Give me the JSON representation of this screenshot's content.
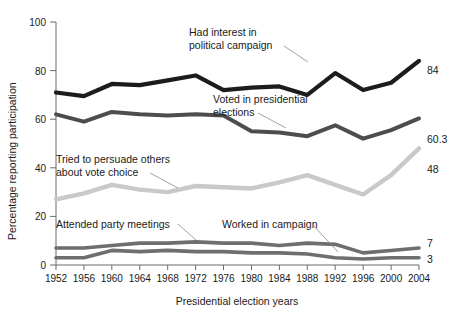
{
  "chart_data": {
    "type": "line",
    "title": "",
    "xlabel": "Presidential election years",
    "ylabel": "Percentage reporting participation",
    "categories": [
      1952,
      1956,
      1960,
      1964,
      1968,
      1972,
      1976,
      1980,
      1984,
      1988,
      1992,
      1996,
      2000,
      2004
    ],
    "xtick_labels": [
      "1952",
      "1956",
      "1960",
      "1964",
      "1968",
      "1972",
      "1976",
      "1980",
      "1984",
      "1988",
      "1992",
      "1996",
      "2000",
      "2004"
    ],
    "ytick_labels": [
      "0",
      "20",
      "40",
      "60",
      "80",
      "100"
    ],
    "yticks": [
      0,
      20,
      40,
      60,
      80,
      100
    ],
    "ylim": [
      0,
      100
    ],
    "xlim": [
      1952,
      2004
    ],
    "grid": false,
    "legend": "inline-annotations",
    "series": [
      {
        "name": "Had interest in political campaign",
        "color": "#1c1c1c",
        "end_value_label": "84",
        "values": [
          71,
          69.5,
          74.5,
          74,
          76,
          78,
          72,
          73,
          73.5,
          70,
          79,
          72,
          75,
          84
        ]
      },
      {
        "name": "Voted in presidential elections",
        "color": "#4d4d4d",
        "end_value_label": "60.3",
        "values": [
          62,
          59,
          63,
          62,
          61.5,
          62,
          61.5,
          55,
          54.5,
          53,
          57.5,
          52,
          55.5,
          60.3
        ]
      },
      {
        "name": "Tried to persuade others about vote choice",
        "color": "#c9c9c9",
        "end_value_label": "48",
        "values": [
          27,
          29.5,
          33,
          31,
          30,
          32.5,
          32,
          31.5,
          34,
          37,
          33,
          29,
          37,
          48
        ]
      },
      {
        "name": "Attended party meetings",
        "color": "#6e6e6e",
        "end_value_label": "7",
        "values": [
          7,
          7,
          8,
          9,
          9,
          9.5,
          9,
          9,
          8,
          9,
          8.5,
          5,
          6,
          7
        ]
      },
      {
        "name": "Worked in campaign",
        "color": "#6e6e6e",
        "end_value_label": "3",
        "values": [
          3,
          3,
          6,
          5.5,
          6,
          5.5,
          5.5,
          5,
          5,
          4.5,
          3,
          2.5,
          3,
          3
        ]
      }
    ],
    "annotations": [
      {
        "id": "ann-interest",
        "text_lines": [
          "Had interest in",
          "political campaign"
        ]
      },
      {
        "id": "ann-voted",
        "text_lines": [
          "Voted in presidential",
          "elections"
        ]
      },
      {
        "id": "ann-persuade",
        "text_lines": [
          "Tried to persuade others",
          "about vote choice"
        ]
      },
      {
        "id": "ann-meetings",
        "text_lines": [
          "Attended party meetings"
        ]
      },
      {
        "id": "ann-worked",
        "text_lines": [
          "Worked in campaign"
        ]
      }
    ]
  },
  "labels": {
    "y_axis_title": "Percentage reporting participation",
    "x_axis_title": "Presidential election years",
    "y0": "0",
    "y20": "20",
    "y40": "40",
    "y60": "60",
    "y80": "80",
    "y100": "100",
    "x1952": "1952",
    "x1956": "1956",
    "x1960": "1960",
    "x1964": "1964",
    "x1968": "1968",
    "x1972": "1972",
    "x1976": "1976",
    "x1980": "1980",
    "x1984": "1984",
    "x1988": "1988",
    "x1992": "1992",
    "x1996": "1996",
    "x2000": "2000",
    "x2004": "2004",
    "end_interest": "84",
    "end_voted": "60.3",
    "end_persuade": "48",
    "end_meetings": "7",
    "end_worked": "3",
    "ann_interest_l1": "Had interest in",
    "ann_interest_l2": "political campaign",
    "ann_voted_l1": "Voted in presidential",
    "ann_voted_l2": "elections",
    "ann_persuade_l1": "Tried to persuade others",
    "ann_persuade_l2": "about vote choice",
    "ann_meetings": "Attended party meetings",
    "ann_worked": "Worked in campaign"
  },
  "colors": {
    "interest": "#1c1c1c",
    "voted": "#4d4d4d",
    "persuade": "#c9c9c9",
    "meetings": "#6e6e6e",
    "worked": "#6e6e6e",
    "axis": "#6b6b6b",
    "background": "#ffffff"
  }
}
